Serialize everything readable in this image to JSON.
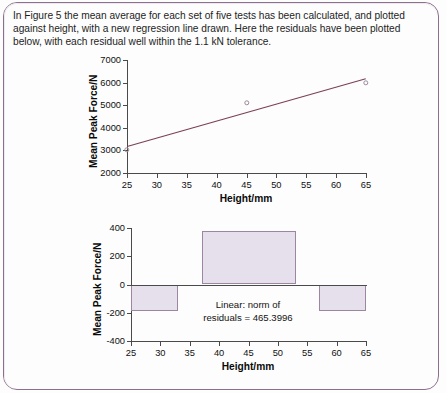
{
  "document": {
    "intro_text": "In Figure 5 the mean average for each set of five tests has been calculated, and plotted against height, with a new regression line drawn. Here the residuals have been plotted below, with each residual well within the 1.1 kN tolerance."
  },
  "theme": {
    "frame_color": "#8d6f8e",
    "regression_line_color": "#7b3e52",
    "marker_edge_color": "#9a8a9c",
    "bar_fill_color": "#e6e0ec",
    "bar_edge_color": "#9d86a0",
    "axis_color": "#4a4a4a",
    "text_color": "#141414"
  },
  "chart_data": [
    {
      "id": "scatter-regression",
      "type": "scatter",
      "title": "",
      "xlabel": "Height/mm",
      "ylabel": "Mean Peak Force/N",
      "xlim": [
        25,
        65
      ],
      "ylim": [
        2000,
        7000
      ],
      "xticks": [
        25,
        30,
        35,
        40,
        45,
        50,
        55,
        60,
        65
      ],
      "xtick_labels": [
        "25",
        "30",
        "35",
        "40",
        "45",
        "50",
        "55",
        "60",
        "65"
      ],
      "yticks": [
        2000,
        3000,
        4000,
        5000,
        6000,
        7000
      ],
      "ytick_labels": [
        "2000",
        "3000",
        "4000",
        "5000",
        "6000",
        "7000"
      ],
      "grid": false,
      "legend": "none",
      "series": [
        {
          "name": "Mean of five tests",
          "marker": "open-circle",
          "x": [
            25,
            45,
            65
          ],
          "y": [
            3030,
            5100,
            6000
          ]
        }
      ],
      "fit_line": {
        "name": "Linear regression",
        "x": [
          25,
          65
        ],
        "y": [
          3200,
          6200
        ]
      }
    },
    {
      "id": "residuals-bar",
      "type": "bar",
      "title": "",
      "xlabel": "Height/mm",
      "ylabel": "Mean Peak Force/N",
      "xlim": [
        25,
        65
      ],
      "ylim": [
        -400,
        400
      ],
      "xticks": [
        25,
        30,
        35,
        40,
        45,
        50,
        55,
        60,
        65
      ],
      "xtick_labels": [
        "25",
        "30",
        "35",
        "40",
        "45",
        "50",
        "55",
        "60",
        "65"
      ],
      "yticks": [
        -400,
        -200,
        0,
        200,
        400
      ],
      "ytick_labels": [
        "-400",
        "-200",
        "0",
        "200",
        "400"
      ],
      "grid": false,
      "legend": "none",
      "bar_width": 16,
      "categories": [
        25,
        45,
        65
      ],
      "values": [
        -190,
        380,
        -190
      ],
      "annotation": {
        "line1": "Linear: norm of",
        "line2": "residuals = 465.3996",
        "x": 45,
        "y": -110
      }
    }
  ]
}
